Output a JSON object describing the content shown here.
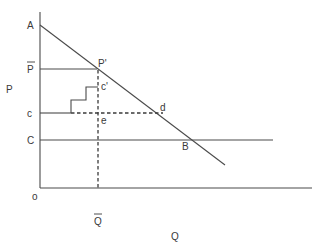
{
  "diagram": {
    "y_axis_label": "P",
    "x_axis_label": "Q",
    "origin_label": "o",
    "labels": {
      "A": "A",
      "P_bar": "P",
      "P_prime": "P'",
      "c_lower": "c",
      "c_prime": "c'",
      "C_upper": "C",
      "d": "d",
      "e": "e",
      "B": "B",
      "Q_bar": "Q"
    },
    "colors": {
      "line": "#4a4a4a",
      "text": "#3a3a3a",
      "background": "#ffffff"
    }
  }
}
